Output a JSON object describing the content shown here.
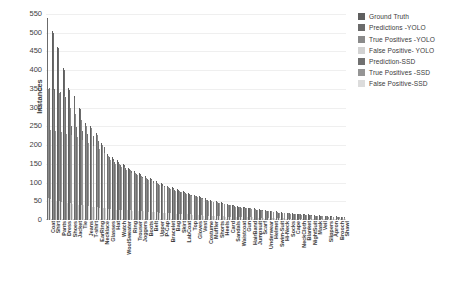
{
  "chart_data": {
    "type": "bar",
    "title": "",
    "xlabel": "",
    "ylabel": "Instances",
    "ylim": [
      0,
      550
    ],
    "ytick_step": 50,
    "yticks": [
      0,
      50,
      100,
      150,
      200,
      250,
      300,
      350,
      400,
      450,
      500,
      550
    ],
    "grid": true,
    "legend_position": "top-right",
    "categories": [
      "Coat",
      "Shirt",
      "Pants",
      "Dress",
      "Shoes",
      "Jacket",
      "Tie",
      "Jeans",
      "T-shirt",
      "EarRing",
      "Necklace",
      "Glasses",
      "Hat",
      "Watch",
      "WoolSweater",
      "Ring",
      "Trouser",
      "Joggers",
      "Boots",
      "Belt",
      "Upper",
      "P-Cap",
      "Bracelet",
      "Bag",
      "Skirt",
      "LabCoat",
      "Top",
      "Gloves",
      "Vest",
      "Costume",
      "Muffler",
      "Shorts",
      "Heels",
      "Card",
      "Sandals",
      "Waistcoat",
      "Gun",
      "HairBand",
      "Jumpsuit",
      "Scarf",
      "Underwear",
      "Helmet",
      "Swim-Suit",
      "Hi-Neck",
      "Socks",
      "Cape",
      "NeckCloth",
      "Blanket",
      "NightSuit",
      "Mask",
      "Veil",
      "Slippers",
      "Apron",
      "Brooch",
      "Shawl"
    ],
    "series": [
      {
        "name": "Ground Truth",
        "color": "#5f5f5f",
        "values": [
          540,
          505,
          462,
          405,
          352,
          330,
          300,
          258,
          250,
          232,
          205,
          175,
          168,
          160,
          150,
          140,
          132,
          125,
          118,
          112,
          105,
          98,
          92,
          88,
          82,
          78,
          72,
          68,
          63,
          58,
          54,
          50,
          47,
          44,
          41,
          38,
          35,
          33,
          31,
          29,
          27,
          25,
          23,
          21,
          20,
          18,
          17,
          16,
          15,
          14,
          13,
          12,
          11,
          10,
          9
        ]
      },
      {
        "name": "Predictions -YOLO",
        "color": "#6b6b6b",
        "values": [
          536,
          500,
          458,
          400,
          348,
          326,
          296,
          254,
          246,
          228,
          200,
          172,
          164,
          156,
          147,
          137,
          129,
          122,
          115,
          109,
          102,
          95,
          90,
          85,
          80,
          76,
          70,
          66,
          61,
          56,
          52,
          48,
          45,
          42,
          39,
          36,
          34,
          32,
          30,
          28,
          26,
          24,
          22,
          20,
          19,
          17,
          16,
          15,
          14,
          13,
          12,
          11,
          10,
          9,
          8
        ]
      },
      {
        "name": "True Positives -YOLO",
        "color": "#8a8a8a",
        "values": [
          350,
          348,
          340,
          330,
          300,
          283,
          268,
          250,
          246,
          228,
          200,
          170,
          158,
          150,
          142,
          133,
          125,
          118,
          112,
          106,
          99,
          92,
          87,
          82,
          77,
          73,
          68,
          64,
          59,
          54,
          50,
          47,
          44,
          41,
          38,
          35,
          33,
          31,
          29,
          27,
          25,
          23,
          21,
          19,
          18,
          16,
          15,
          14,
          13,
          12,
          11,
          10,
          9,
          8,
          7
        ]
      },
      {
        "name": "False Positive- YOLO",
        "color": "#d2d2d2",
        "values": [
          60,
          55,
          52,
          48,
          45,
          43,
          40,
          38,
          36,
          34,
          32,
          30,
          29,
          28,
          27,
          26,
          25,
          24,
          23,
          22,
          21,
          20,
          19,
          18,
          17,
          16,
          15,
          14,
          13,
          12,
          11,
          10,
          10,
          9,
          9,
          8,
          8,
          7,
          7,
          6,
          6,
          5,
          5,
          5,
          4,
          4,
          4,
          3,
          3,
          3,
          3,
          2,
          2,
          2,
          2
        ]
      },
      {
        "name": "Prediction-SSD",
        "color": "#707070",
        "values": [
          352,
          350,
          342,
          328,
          252,
          248,
          238,
          230,
          224,
          212,
          196,
          168,
          156,
          148,
          140,
          131,
          123,
          116,
          110,
          104,
          97,
          91,
          86,
          81,
          76,
          72,
          67,
          63,
          58,
          53,
          49,
          46,
          43,
          40,
          37,
          34,
          32,
          30,
          28,
          26,
          24,
          22,
          20,
          19,
          18,
          16,
          15,
          14,
          13,
          12,
          11,
          10,
          9,
          8,
          7
        ]
      },
      {
        "name": "True Positives -SSD",
        "color": "#959595",
        "values": [
          240,
          238,
          235,
          230,
          228,
          222,
          214,
          205,
          198,
          190,
          180,
          160,
          150,
          142,
          134,
          126,
          119,
          112,
          106,
          100,
          94,
          88,
          83,
          78,
          74,
          70,
          65,
          61,
          56,
          52,
          48,
          45,
          42,
          39,
          36,
          33,
          31,
          29,
          27,
          25,
          23,
          21,
          20,
          18,
          17,
          15,
          14,
          13,
          12,
          11,
          10,
          9,
          8,
          7,
          6
        ]
      },
      {
        "name": "False Positive-SSD",
        "color": "#dcdcdc",
        "values": [
          56,
          52,
          49,
          46,
          43,
          41,
          39,
          37,
          35,
          33,
          31,
          29,
          28,
          27,
          26,
          25,
          24,
          23,
          22,
          21,
          20,
          19,
          18,
          17,
          16,
          15,
          14,
          13,
          12,
          11,
          11,
          10,
          9,
          9,
          8,
          8,
          7,
          7,
          6,
          6,
          5,
          5,
          5,
          4,
          4,
          4,
          3,
          3,
          3,
          3,
          2,
          2,
          2,
          2,
          2
        ]
      }
    ]
  },
  "legend": {
    "items": [
      {
        "label": "Ground Truth",
        "color": "#5f5f5f"
      },
      {
        "label": "Predictions -YOLO",
        "color": "#6b6b6b"
      },
      {
        "label": "True Positives -YOLO",
        "color": "#8a8a8a"
      },
      {
        "label": "False Positive- YOLO",
        "color": "#d2d2d2"
      },
      {
        "label": "Prediction-SSD",
        "color": "#707070"
      },
      {
        "label": "True Positives -SSD",
        "color": "#959595"
      },
      {
        "label": "False Positive-SSD",
        "color": "#dcdcdc"
      }
    ]
  }
}
